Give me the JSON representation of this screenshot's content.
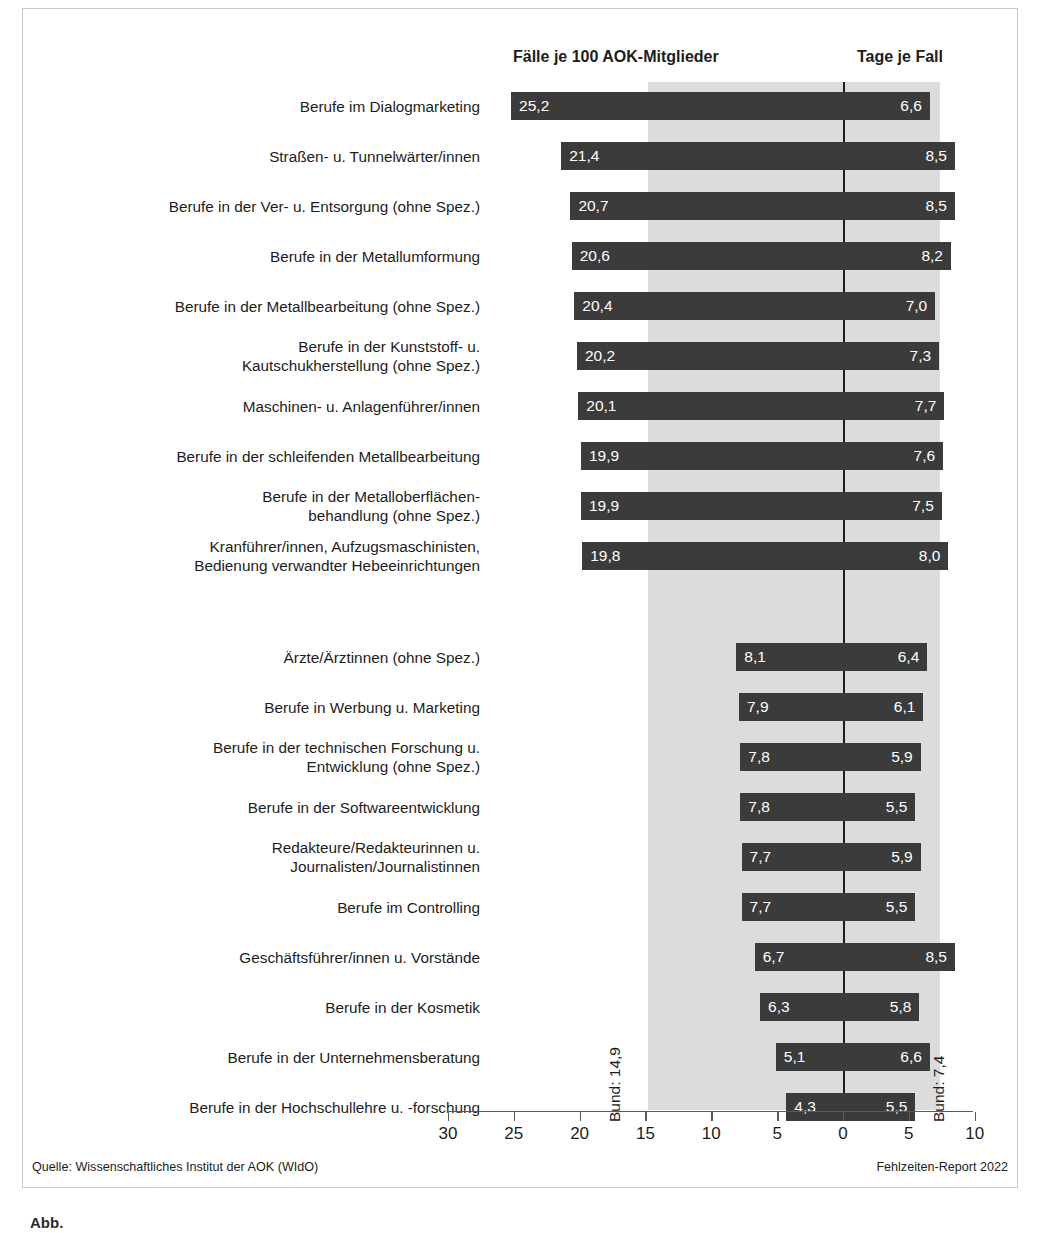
{
  "headers": {
    "left_column": "Fälle je 100 AOK-Mitglieder",
    "right_column": "Tage je Fall"
  },
  "annotations": {
    "bund_left": "Bund: 14,9",
    "bund_right": "Bund: 7,4"
  },
  "footer": {
    "source": "Quelle: Wissenschaftliches Institut der AOK (WIdO)",
    "report": "Fehlzeiten-Report 2022"
  },
  "caption": "Abb.",
  "axis": {
    "labels": [
      "30",
      "25",
      "20",
      "15",
      "10",
      "5",
      "0",
      "5",
      "10"
    ]
  },
  "colors": {
    "bar": "#3b3b3b",
    "band": "#dcdcdc",
    "zeroline": "#1d1d1b",
    "text": "#1d1d1b",
    "value_text": "#ffffff"
  },
  "chart_data": {
    "type": "bar",
    "title": "",
    "subtitle": "",
    "orientation": "horizontal",
    "style": "diverging-butterfly",
    "xlabel_left": "Fälle je 100 AOK-Mitglieder",
    "xlabel_right": "Tage je Fall",
    "ylabel": "",
    "grid": false,
    "legend": "none",
    "axis_ticks": [
      30,
      25,
      20,
      15,
      10,
      5,
      0,
      5,
      10
    ],
    "axis_tick_labels": [
      "30",
      "25",
      "20",
      "15",
      "10",
      "5",
      "0",
      "5",
      "10"
    ],
    "xlim_left": [
      0,
      30
    ],
    "xlim_right": [
      0,
      10
    ],
    "reference_band": {
      "left_value": 14.9,
      "right_value": 7.4,
      "left_label": "Bund: 14,9",
      "right_label": "Bund: 7,4"
    },
    "categories": [
      "Berufe im Dialogmarketing",
      "Straßen- u. Tunnelwärter/innen",
      "Berufe in der Ver- u. Entsorgung (ohne Spez.)",
      "Berufe in der Metallumformung",
      "Berufe in der Metallbearbeitung (ohne Spez.)",
      "Berufe in der Kunststoff- u.\nKautschukherstellung (ohne Spez.)",
      "Maschinen- u. Anlagenführer/innen",
      "Berufe in der schleifenden Metallbearbeitung",
      "Berufe in der Metalloberflächen-\nbehandlung (ohne Spez.)",
      "Kranführer/innen, Aufzugsmaschinisten,\nBedienung verwandter Hebeeinrichtungen",
      "Ärzte/Ärztinnen (ohne Spez.)",
      "Berufe in Werbung u. Marketing",
      "Berufe in der technischen Forschung u.\nEntwicklung (ohne Spez.)",
      "Berufe in der Softwareentwicklung",
      "Redakteure/Redakteurinnen u.\nJournalisten/Journalistinnen",
      "Berufe im Controlling",
      "Geschäftsführer/innen u. Vorstände",
      "Berufe in der Kosmetik",
      "Berufe in der Unternehmensberatung",
      "Berufe in der Hochschullehre u. -forschung"
    ],
    "series": [
      {
        "name": "Fälle je 100 AOK-Mitglieder",
        "side": "left",
        "values": [
          25.2,
          21.4,
          20.7,
          20.6,
          20.4,
          20.2,
          20.1,
          19.9,
          19.9,
          19.8,
          8.1,
          7.9,
          7.8,
          7.8,
          7.7,
          7.7,
          6.7,
          6.3,
          5.1,
          4.3
        ],
        "labels": [
          "25,2",
          "21,4",
          "20,7",
          "20,6",
          "20,4",
          "20,2",
          "20,1",
          "19,9",
          "19,9",
          "19,8",
          "8,1",
          "7,9",
          "7,8",
          "7,8",
          "7,7",
          "7,7",
          "6,7",
          "6,3",
          "5,1",
          "4,3"
        ]
      },
      {
        "name": "Tage je Fall",
        "side": "right",
        "values": [
          6.6,
          8.5,
          8.5,
          8.2,
          7.0,
          7.3,
          7.7,
          7.6,
          7.5,
          8.0,
          6.4,
          6.1,
          5.9,
          5.5,
          5.9,
          5.5,
          8.5,
          5.8,
          6.6,
          5.5
        ],
        "labels": [
          "6,6",
          "8,5",
          "8,5",
          "8,2",
          "7,0",
          "7,3",
          "7,7",
          "7,6",
          "7,5",
          "8,0",
          "6,4",
          "6,1",
          "5,9",
          "5,5",
          "5,9",
          "5,5",
          "8,5",
          "5,8",
          "6,6",
          "5,5"
        ]
      }
    ],
    "group_gap_after_index": 9
  }
}
